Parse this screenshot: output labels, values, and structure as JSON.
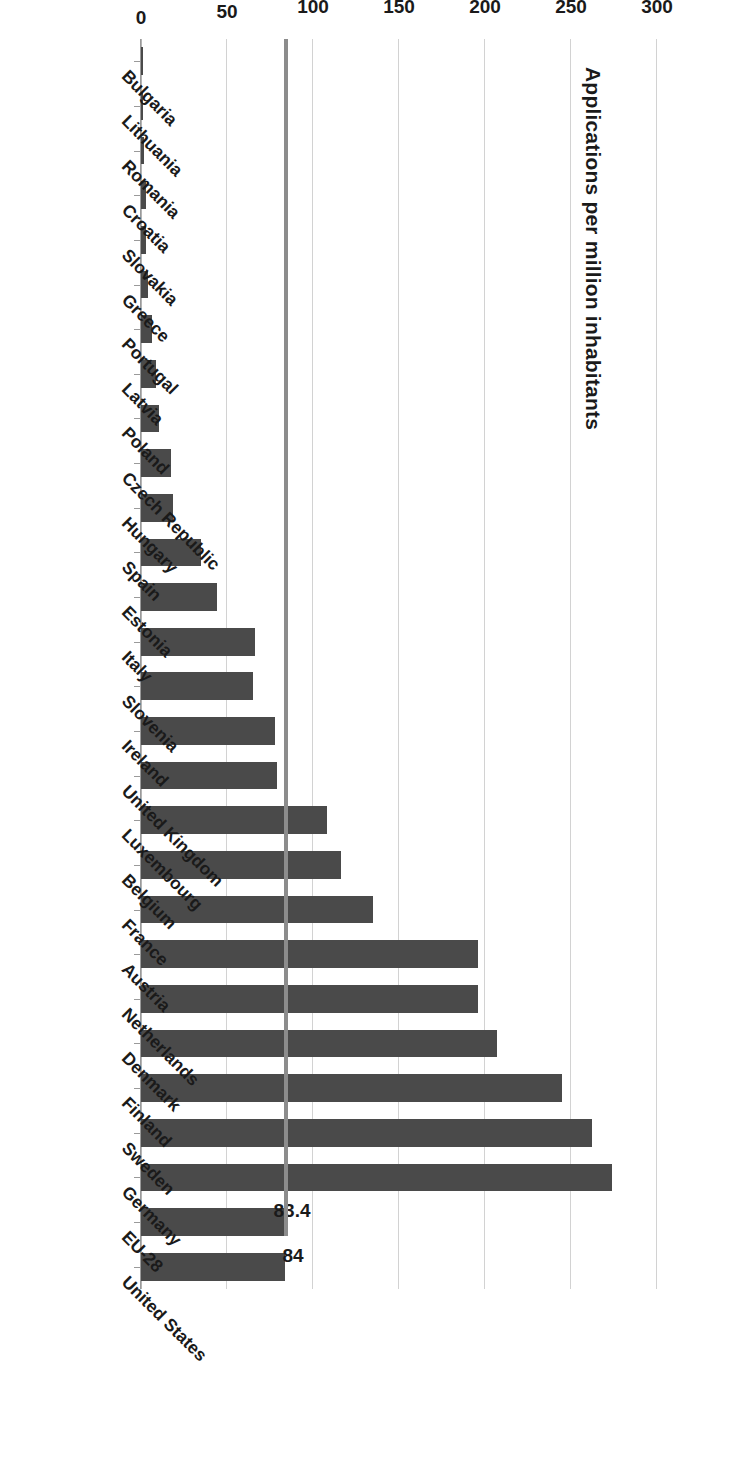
{
  "chart_data": {
    "type": "bar",
    "orientation": "vertical-rotated",
    "title": "",
    "xlabel": "",
    "ylabel": "Applications per million inhabitants",
    "ylim": [
      0,
      300
    ],
    "yticks": [
      0,
      50,
      100,
      150,
      200,
      250,
      300
    ],
    "ytick_labels": [
      "0",
      "50",
      "100",
      "150",
      "200",
      "250",
      "300"
    ],
    "grid": true,
    "legend": false,
    "reference_line": {
      "label": "83.4",
      "value": 83.4,
      "color": "#8c8c8c"
    },
    "bar_color": "#4a4a4a",
    "categories": [
      "Bulgaria",
      "Lithuania",
      "Romania",
      "Croatia",
      "Slovakia",
      "Greece",
      "Portugal",
      "Latvia",
      "Poland",
      "Czech Republic",
      "Hungary",
      "Spain",
      "Estonia",
      "Italy",
      "Slovenia",
      "Ireland",
      "United Kingdom",
      "Luxembourg",
      "Belgium",
      "France",
      "Austria",
      "Netherlands",
      "Denmark",
      "Finland",
      "Sweden",
      "Germany",
      "EU-28",
      "United States"
    ],
    "values": [
      1.0,
      1.3,
      1.8,
      2.9,
      3.0,
      4.2,
      6.4,
      8.7,
      10.5,
      17.2,
      18.5,
      35.0,
      44.0,
      66.0,
      65.0,
      78.0,
      79.0,
      108.0,
      116.0,
      135.0,
      196.0,
      196.0,
      207.0,
      245.0,
      262.0,
      274.0,
      83.4,
      84.0
    ],
    "data_labels": {
      "EU-28": "83.4",
      "United States": "84"
    }
  },
  "axis": {
    "title": "Applications per million inhabitants",
    "tick_labels": [
      "300",
      "250",
      "200",
      "150",
      "100",
      "50",
      "0"
    ]
  }
}
